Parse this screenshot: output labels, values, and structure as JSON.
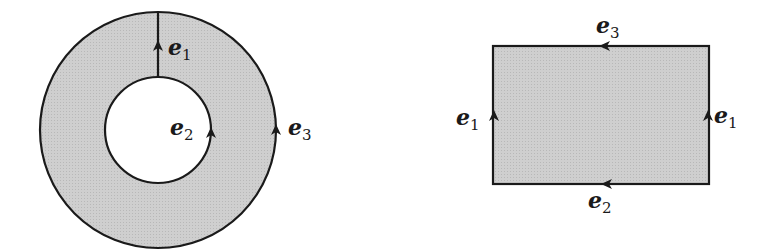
{
  "colors": {
    "fill": "#c9c9c9",
    "stroke": "#1a1a1a",
    "background": "#ffffff"
  },
  "annulus": {
    "outer_center": [
      158,
      130
    ],
    "outer_radius": 118,
    "inner_radius": 53,
    "edges": [
      {
        "label": "e",
        "sub": "1",
        "description": "radial cut from inner to outer circle, arrow pointing up"
      },
      {
        "label": "e",
        "sub": "2",
        "description": "inner circle, arrow pointing up (counterclockwise)"
      },
      {
        "label": "e",
        "sub": "3",
        "description": "outer circle, arrow pointing up (counterclockwise)"
      }
    ]
  },
  "rectangle": {
    "x": 493,
    "y": 46,
    "width": 216,
    "height": 138,
    "edges": [
      {
        "label": "e",
        "sub": "3",
        "side": "top",
        "direction": "left"
      },
      {
        "label": "e",
        "sub": "1",
        "side": "left",
        "direction": "up"
      },
      {
        "label": "e",
        "sub": "1",
        "side": "right",
        "direction": "up"
      },
      {
        "label": "e",
        "sub": "2",
        "side": "bottom",
        "direction": "left"
      }
    ]
  },
  "labels": {
    "a_e1": {
      "main": "e",
      "sub": "1"
    },
    "a_e2": {
      "main": "e",
      "sub": "2"
    },
    "a_e3": {
      "main": "e",
      "sub": "3"
    },
    "r_top": {
      "main": "e",
      "sub": "3"
    },
    "r_left": {
      "main": "e",
      "sub": "1"
    },
    "r_right": {
      "main": "e",
      "sub": "1"
    },
    "r_bottom": {
      "main": "e",
      "sub": "2"
    }
  }
}
